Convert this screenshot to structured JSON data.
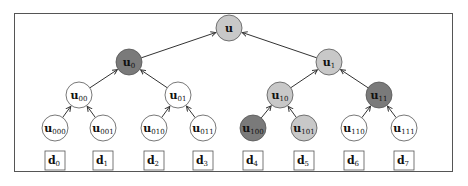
{
  "diagram": {
    "type": "binary-tree",
    "colors": {
      "white": "#ffffff",
      "light": "#c8c8c8",
      "dark": "#7a7a7a",
      "stroke": "#444444"
    },
    "nodes": [
      {
        "id": "u",
        "base": "u",
        "sub": "",
        "x": 229,
        "y": 28,
        "fill": "light"
      },
      {
        "id": "u0",
        "base": "u",
        "sub": "0",
        "x": 129,
        "y": 62,
        "fill": "dark"
      },
      {
        "id": "u1",
        "base": "u",
        "sub": "1",
        "x": 329,
        "y": 62,
        "fill": "light"
      },
      {
        "id": "u00",
        "base": "u",
        "sub": "00",
        "x": 79,
        "y": 95,
        "fill": "white"
      },
      {
        "id": "u01",
        "base": "u",
        "sub": "01",
        "x": 178,
        "y": 95,
        "fill": "white"
      },
      {
        "id": "u10",
        "base": "u",
        "sub": "10",
        "x": 280,
        "y": 95,
        "fill": "light"
      },
      {
        "id": "u11",
        "base": "u",
        "sub": "11",
        "x": 379,
        "y": 95,
        "fill": "dark"
      },
      {
        "id": "u000",
        "base": "u",
        "sub": "000",
        "x": 55,
        "y": 128,
        "fill": "white"
      },
      {
        "id": "u001",
        "base": "u",
        "sub": "001",
        "x": 103,
        "y": 128,
        "fill": "white"
      },
      {
        "id": "u010",
        "base": "u",
        "sub": "010",
        "x": 154,
        "y": 128,
        "fill": "white"
      },
      {
        "id": "u011",
        "base": "u",
        "sub": "011",
        "x": 203,
        "y": 128,
        "fill": "white"
      },
      {
        "id": "u100",
        "base": "u",
        "sub": "100",
        "x": 253,
        "y": 128,
        "fill": "dark"
      },
      {
        "id": "u101",
        "base": "u",
        "sub": "101",
        "x": 304,
        "y": 128,
        "fill": "light"
      },
      {
        "id": "u110",
        "base": "u",
        "sub": "110",
        "x": 354,
        "y": 128,
        "fill": "white"
      },
      {
        "id": "u111",
        "base": "u",
        "sub": "111",
        "x": 404,
        "y": 128,
        "fill": "white"
      }
    ],
    "edges": [
      [
        "u0",
        "u"
      ],
      [
        "u1",
        "u"
      ],
      [
        "u00",
        "u0"
      ],
      [
        "u01",
        "u0"
      ],
      [
        "u10",
        "u1"
      ],
      [
        "u11",
        "u1"
      ],
      [
        "u000",
        "u00"
      ],
      [
        "u001",
        "u00"
      ],
      [
        "u010",
        "u01"
      ],
      [
        "u011",
        "u01"
      ],
      [
        "u100",
        "u10"
      ],
      [
        "u101",
        "u10"
      ],
      [
        "u110",
        "u11"
      ],
      [
        "u111",
        "u11"
      ]
    ],
    "data_boxes": [
      {
        "base": "d",
        "sub": "0",
        "x": 55,
        "y": 161
      },
      {
        "base": "d",
        "sub": "1",
        "x": 103,
        "y": 161
      },
      {
        "base": "d",
        "sub": "2",
        "x": 154,
        "y": 161
      },
      {
        "base": "d",
        "sub": "3",
        "x": 203,
        "y": 161
      },
      {
        "base": "d",
        "sub": "4",
        "x": 253,
        "y": 161
      },
      {
        "base": "d",
        "sub": "5",
        "x": 304,
        "y": 161
      },
      {
        "base": "d",
        "sub": "6",
        "x": 354,
        "y": 161
      },
      {
        "base": "d",
        "sub": "7",
        "x": 404,
        "y": 161
      }
    ]
  }
}
